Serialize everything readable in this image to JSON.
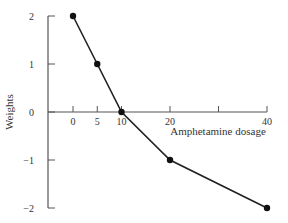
{
  "chart_data": {
    "type": "line",
    "title": "",
    "xlabel": "Amphetamine dosage",
    "ylabel": "Weights",
    "x": [
      0,
      5,
      10,
      20,
      40
    ],
    "series": [
      {
        "name": "Weights",
        "values": [
          2,
          1,
          0,
          -1,
          -2
        ]
      }
    ],
    "x_ticks": [
      0,
      5,
      10,
      20,
      30,
      40
    ],
    "x_tick_labels": [
      "0",
      "5",
      "10",
      "20",
      "",
      "40"
    ],
    "y_ticks": [
      2,
      1,
      0,
      -1,
      -2
    ],
    "y_tick_labels": [
      "2",
      "1",
      "0",
      "−1",
      "−2"
    ],
    "xlim": [
      0,
      40
    ],
    "ylim": [
      -2,
      2
    ],
    "grid": false,
    "legend": "none",
    "colors": {
      "line": "#222222",
      "axis": "#555555",
      "marker": "#111111"
    }
  }
}
